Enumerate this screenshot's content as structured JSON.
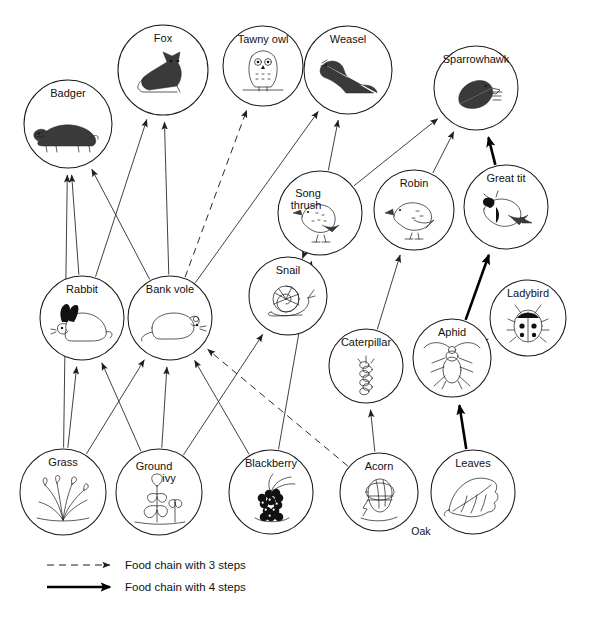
{
  "diagram": {
    "oak_label": "Oak",
    "nodes": [
      {
        "id": "badger",
        "label": "Badger",
        "x": 68,
        "y": 124,
        "r": 44,
        "icon": "badger-icon"
      },
      {
        "id": "fox",
        "label": "Fox",
        "x": 163,
        "y": 70,
        "r": 45,
        "icon": "fox-icon"
      },
      {
        "id": "tawny_owl",
        "label": "Tawny owl",
        "x": 263,
        "y": 66,
        "r": 40,
        "icon": "owl-icon"
      },
      {
        "id": "weasel",
        "label": "Weasel",
        "x": 348,
        "y": 70,
        "r": 44,
        "icon": "weasel-icon"
      },
      {
        "id": "sparrowhawk",
        "label": "Sparrowhawk",
        "x": 476,
        "y": 88,
        "r": 42,
        "icon": "sparrowhawk-icon"
      },
      {
        "id": "song_thrush",
        "label": "Song thrush",
        "x": 320,
        "y": 213,
        "r": 42,
        "icon": "thrush-icon"
      },
      {
        "id": "robin",
        "label": "Robin",
        "x": 414,
        "y": 210,
        "r": 40,
        "icon": "robin-icon"
      },
      {
        "id": "great_tit",
        "label": "Great tit",
        "x": 506,
        "y": 207,
        "r": 42,
        "icon": "great-tit-icon"
      },
      {
        "id": "snail",
        "label": "Snail",
        "x": 288,
        "y": 296,
        "r": 39,
        "icon": "snail-icon"
      },
      {
        "id": "ladybird",
        "label": "Ladybird",
        "x": 528,
        "y": 318,
        "r": 38,
        "icon": "ladybird-icon"
      },
      {
        "id": "caterpillar",
        "label": "Caterpillar",
        "x": 366,
        "y": 366,
        "r": 37,
        "icon": "caterpillar-icon"
      },
      {
        "id": "aphid",
        "label": "Aphid",
        "x": 452,
        "y": 358,
        "r": 39,
        "icon": "aphid-icon"
      },
      {
        "id": "rabbit",
        "label": "Rabbit",
        "x": 82,
        "y": 318,
        "r": 42,
        "icon": "rabbit-icon"
      },
      {
        "id": "bank_vole",
        "label": "Bank vole",
        "x": 170,
        "y": 318,
        "r": 42,
        "icon": "vole-icon"
      },
      {
        "id": "grass",
        "label": "Grass",
        "x": 63,
        "y": 492,
        "r": 43,
        "icon": "grass-icon"
      },
      {
        "id": "ground_ivy",
        "label": "Ground ivy",
        "x": 159,
        "y": 492,
        "r": 43,
        "icon": "ivy-icon"
      },
      {
        "id": "blackberry",
        "label": "Blackberry",
        "x": 271,
        "y": 492,
        "r": 42,
        "icon": "blackberry-icon"
      },
      {
        "id": "acorn",
        "label": "Acorn",
        "x": 379,
        "y": 492,
        "r": 39,
        "icon": "acorn-icon"
      },
      {
        "id": "leaves",
        "label": "Leaves",
        "x": 473,
        "y": 492,
        "r": 42,
        "icon": "leaf-icon"
      }
    ],
    "edges": [
      {
        "from": "grass",
        "to": "badger",
        "style": "thin"
      },
      {
        "from": "rabbit",
        "to": "badger",
        "style": "thin"
      },
      {
        "from": "bank_vole",
        "to": "badger",
        "style": "thin"
      },
      {
        "from": "rabbit",
        "to": "fox",
        "style": "thin"
      },
      {
        "from": "bank_vole",
        "to": "fox",
        "style": "thin"
      },
      {
        "from": "bank_vole",
        "to": "tawny_owl",
        "style": "dashed"
      },
      {
        "from": "bank_vole",
        "to": "weasel",
        "style": "thin"
      },
      {
        "from": "song_thrush",
        "to": "weasel",
        "style": "thin"
      },
      {
        "from": "song_thrush",
        "to": "sparrowhawk",
        "style": "thin"
      },
      {
        "from": "robin",
        "to": "sparrowhawk",
        "style": "thin"
      },
      {
        "from": "great_tit",
        "to": "sparrowhawk",
        "style": "bold"
      },
      {
        "from": "snail",
        "to": "song_thrush",
        "style": "thin"
      },
      {
        "from": "blackberry",
        "to": "song_thrush",
        "style": "thin"
      },
      {
        "from": "caterpillar",
        "to": "robin",
        "style": "thin"
      },
      {
        "from": "aphid",
        "to": "great_tit",
        "style": "bold"
      },
      {
        "from": "aphid",
        "to": "ladybird",
        "style": "thin"
      },
      {
        "from": "acorn",
        "to": "caterpillar",
        "style": "thin"
      },
      {
        "from": "leaves",
        "to": "aphid",
        "style": "bold"
      },
      {
        "from": "ground_ivy",
        "to": "snail",
        "style": "thin"
      },
      {
        "from": "grass",
        "to": "rabbit",
        "style": "thin"
      },
      {
        "from": "ground_ivy",
        "to": "rabbit",
        "style": "thin"
      },
      {
        "from": "grass",
        "to": "bank_vole",
        "style": "thin"
      },
      {
        "from": "ground_ivy",
        "to": "bank_vole",
        "style": "thin"
      },
      {
        "from": "blackberry",
        "to": "bank_vole",
        "style": "thin"
      },
      {
        "from": "acorn",
        "to": "bank_vole",
        "style": "dashed"
      }
    ]
  },
  "legend": {
    "items": [
      {
        "id": "three-steps",
        "style": "dashed",
        "label": "Food chain with 3 steps"
      },
      {
        "id": "four-steps",
        "style": "bold",
        "label": "Food chain with 4 steps"
      }
    ]
  }
}
